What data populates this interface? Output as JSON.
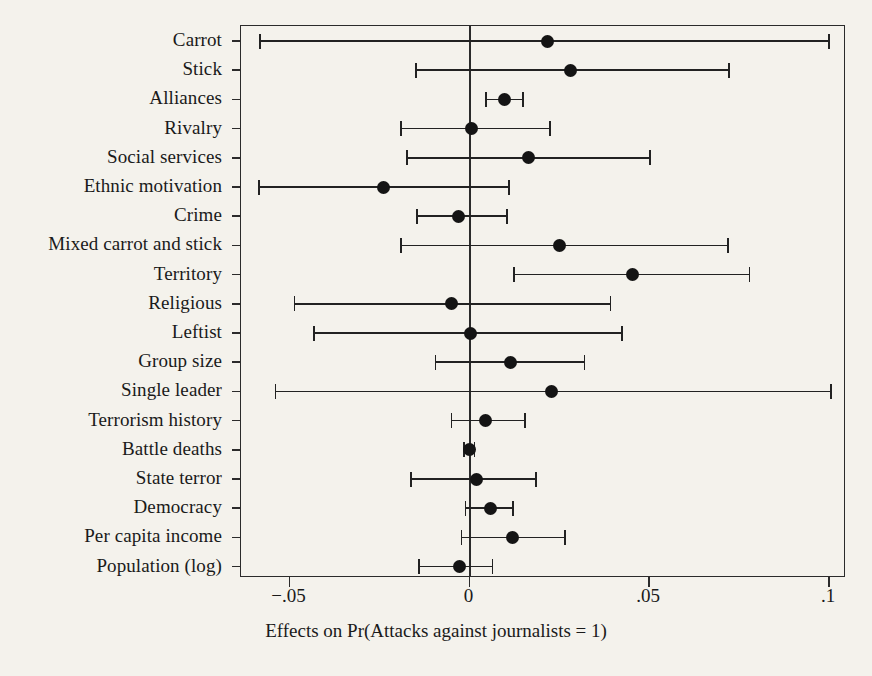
{
  "chart_data": {
    "type": "scatter",
    "subtype": "coefficient-forest-plot",
    "title": "",
    "xlabel": "Effects on Pr(Attacks against journalists = 1)",
    "ylabel": "",
    "xlim": [
      -0.0635,
      0.1047
    ],
    "xticks": [
      -0.05,
      0,
      0.05,
      0.1
    ],
    "xticklabels": [
      "−.05",
      "0",
      ".05",
      ".1"
    ],
    "grid": false,
    "legend": null,
    "reference_line": 0,
    "orientation": "horizontal",
    "categories": [
      "Carrot",
      "Stick",
      "Alliances",
      "Rivalry",
      "Social services",
      "Ethnic motivation",
      "Crime",
      "Mixed carrot and stick",
      "Territory",
      "Religious",
      "Leftist",
      "Group size",
      "Single leader",
      "Terrorism history",
      "Battle deaths",
      "State terror",
      "Democracy",
      "Per capita income",
      "Population (log)"
    ],
    "points": [
      {
        "label": "Carrot",
        "estimate": 0.0218,
        "low": -0.0583,
        "high": 0.1
      },
      {
        "label": "Stick",
        "estimate": 0.0282,
        "low": -0.0149,
        "high": 0.0721
      },
      {
        "label": "Alliances",
        "estimate": 0.0097,
        "low": 0.0047,
        "high": 0.0149
      },
      {
        "label": "Rivalry",
        "estimate": 0.0006,
        "low": -0.0191,
        "high": 0.0224
      },
      {
        "label": "Social services",
        "estimate": 0.0163,
        "low": -0.0174,
        "high": 0.0503
      },
      {
        "label": "Ethnic motivation",
        "estimate": -0.0238,
        "low": -0.0586,
        "high": 0.011
      },
      {
        "label": "Crime",
        "estimate": -0.003,
        "low": -0.0146,
        "high": 0.0105
      },
      {
        "label": "Mixed carrot and stick",
        "estimate": 0.0251,
        "low": -0.0191,
        "high": 0.0718
      },
      {
        "label": "Territory",
        "estimate": 0.0453,
        "low": 0.0124,
        "high": 0.0779
      },
      {
        "label": "Religious",
        "estimate": -0.005,
        "low": -0.0486,
        "high": 0.0392
      },
      {
        "label": "Leftist",
        "estimate": 0.0003,
        "low": -0.0431,
        "high": 0.0425
      },
      {
        "label": "Group size",
        "estimate": 0.0113,
        "low": -0.0094,
        "high": 0.032
      },
      {
        "label": "Single leader",
        "estimate": 0.0229,
        "low": -0.0539,
        "high": 0.1006
      },
      {
        "label": "Terrorism history",
        "estimate": 0.0044,
        "low": -0.005,
        "high": 0.0155
      },
      {
        "label": "Battle deaths",
        "estimate": 0.0,
        "low": -0.0014,
        "high": 0.0014
      },
      {
        "label": "State terror",
        "estimate": 0.0019,
        "low": -0.0163,
        "high": 0.0185
      },
      {
        "label": "Democracy",
        "estimate": 0.0058,
        "low": -0.0011,
        "high": 0.0122
      },
      {
        "label": "Per capita income",
        "estimate": 0.0119,
        "low": -0.0022,
        "high": 0.0265
      },
      {
        "label": "Population (log)",
        "estimate": -0.0028,
        "low": -0.0141,
        "high": 0.0064
      }
    ]
  },
  "colors": {
    "background": "#f4f2ec",
    "axis": "#2b2b2b",
    "marker": "#141414",
    "text": "#1a1a1a"
  }
}
